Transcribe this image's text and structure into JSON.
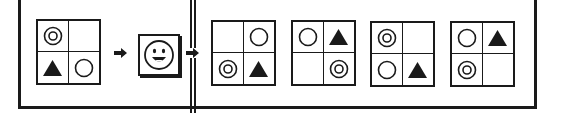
{
  "puzzle": {
    "type": "visual-transformation-puzzle",
    "stroke_color": "#1a1a1a",
    "source_grid": {
      "cells": [
        "double-circle",
        "empty",
        "filled-triangle",
        "circle"
      ]
    },
    "operator": {
      "icon": "smiley-face-icon"
    },
    "options": [
      {
        "cells": [
          "empty",
          "circle",
          "double-circle",
          "filled-triangle"
        ]
      },
      {
        "cells": [
          "circle",
          "filled-triangle",
          "empty",
          "double-circle"
        ]
      },
      {
        "cells": [
          "double-circle",
          "empty",
          "circle",
          "filled-triangle"
        ]
      },
      {
        "cells": [
          "circle",
          "filled-triangle",
          "double-circle",
          "empty"
        ]
      }
    ]
  }
}
